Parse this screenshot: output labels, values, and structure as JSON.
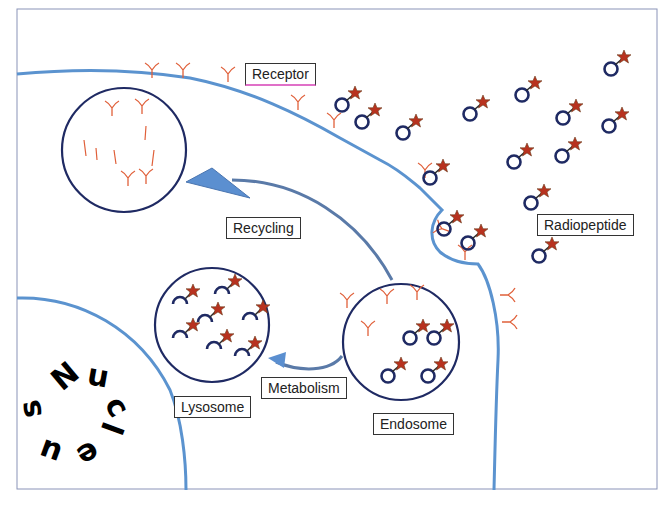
{
  "diagram": {
    "colors": {
      "membrane": "#5b93cf",
      "vesicle_outline": "#1f2a63",
      "receptor": "#e0603a",
      "star": "#b8321f",
      "arrow_fill": "#5b8fd0",
      "frame": "#8a93b8"
    },
    "labels": {
      "receptor": "Receptor",
      "recycling": "Recycling",
      "radiopeptide": "Radiopeptide",
      "metabolism": "Metabolism",
      "lysosome": "Lysosome",
      "endosome": "Endosome",
      "nucleus": "Nucleus"
    },
    "nodes": [
      {
        "id": "recycling-vesicle",
        "label": "",
        "type": "vesicle"
      },
      {
        "id": "lysosome",
        "label": "Lysosome",
        "type": "vesicle"
      },
      {
        "id": "endosome",
        "label": "Endosome",
        "type": "vesicle"
      },
      {
        "id": "nucleus",
        "label": "Nucleus",
        "type": "organelle"
      },
      {
        "id": "cell-membrane",
        "label": "Receptor",
        "type": "membrane"
      },
      {
        "id": "radiopeptides",
        "label": "Radiopeptide",
        "type": "ligand"
      }
    ],
    "edges": [
      {
        "from": "endosome",
        "to": "recycling-vesicle",
        "label": "Recycling"
      },
      {
        "from": "endosome",
        "to": "lysosome",
        "label": "Metabolism"
      }
    ]
  }
}
